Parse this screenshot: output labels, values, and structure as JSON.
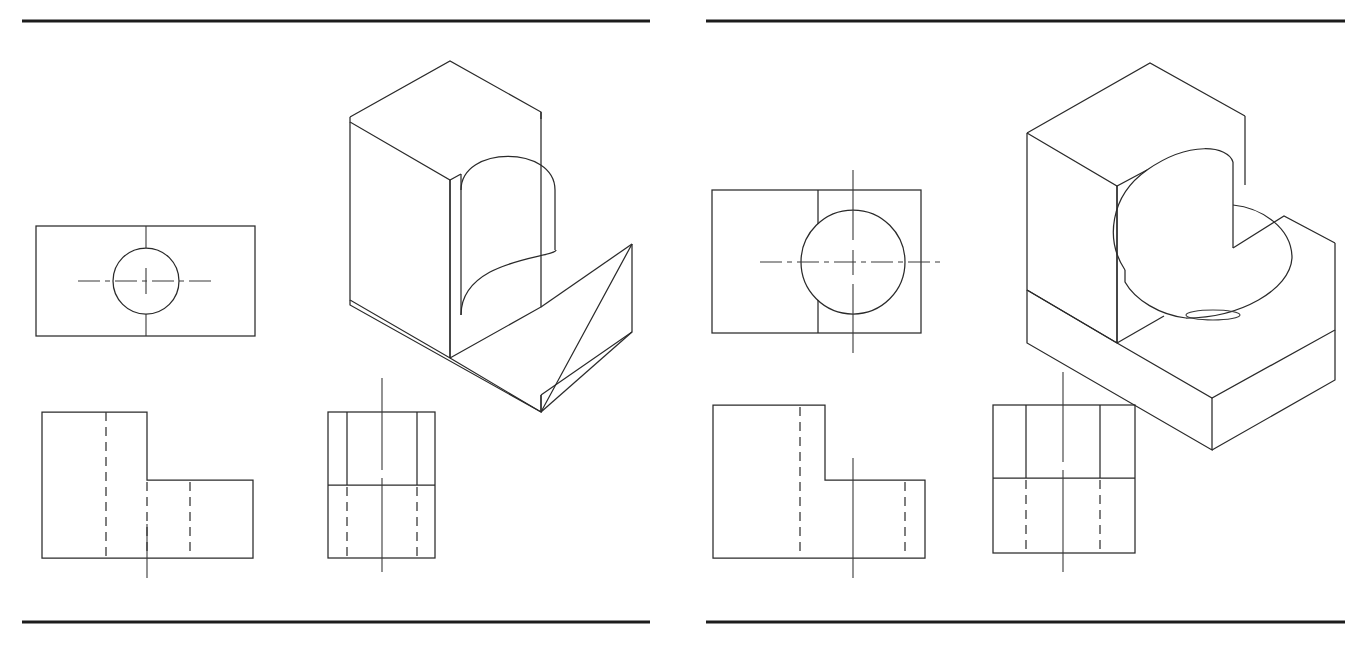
{
  "sheet": {
    "title": "Orthographic and isometric drawing plate",
    "width": 1372,
    "height": 645,
    "background_color": "#ffffff",
    "line_color": "#2a2a2a",
    "rule_color": "#1c1c1c",
    "panel_count": 2
  },
  "panels": [
    {
      "id": "panel-left",
      "name": "left-plate",
      "label": "Left plate",
      "top_rule": {
        "x1": 22,
        "y1": 21,
        "x2": 650,
        "y2": 21
      },
      "bottom_rule": {
        "x1": 22,
        "y1": 622,
        "x2": 650,
        "y2": 622
      },
      "views": [
        {
          "id": "top-view",
          "name": "top-view-left",
          "label": "Top view",
          "outline": {
            "x": 36,
            "y": 226,
            "w": 219,
            "h": 110
          },
          "circle": {
            "cx": 146,
            "cy": 281,
            "r": 33
          },
          "vertical_centerline": {
            "x": 146,
            "y1": 226,
            "y2": 336
          },
          "horizontal_centerline": {
            "y": 281,
            "x1": 78,
            "x2": 214
          },
          "notes": "Rectangle with centered circle, centerlines cross at circle center"
        },
        {
          "id": "front-view",
          "name": "front-view-left",
          "label": "Front view",
          "outline_points": "42,412 147,412 147,480 253,480 253,558 42,558",
          "hidden_lines": [
            {
              "x": 106,
              "y1": 412,
              "y2": 558
            },
            {
              "x": 147,
              "y1": 480,
              "y2": 558
            },
            {
              "x": 190,
              "y1": 480,
              "y2": 558
            }
          ],
          "centerline": {
            "x": 147,
            "y1": 528,
            "y2": 578
          },
          "notes": "L-shaped profile, three hidden lines for the slot, centerline drops below base"
        },
        {
          "id": "side-view",
          "name": "side-view-left",
          "label": "Side view",
          "outline": {
            "x": 328,
            "y": 412,
            "w": 107,
            "h": 146
          },
          "mid_horizontal": {
            "y": 485,
            "x1": 328,
            "x2": 435
          },
          "solid_verticals": [
            {
              "x": 347,
              "y1": 412,
              "y2": 485
            },
            {
              "x": 417,
              "y1": 412,
              "y2": 485
            }
          ],
          "hidden_verticals": [
            {
              "x": 347,
              "y1": 485,
              "y2": 558
            },
            {
              "x": 417,
              "y1": 485,
              "y2": 558
            }
          ],
          "centerline": {
            "x": 382,
            "y1": 378,
            "y2": 572
          },
          "notes": "Rectangle split horizontally; slot edges solid above, hidden below"
        },
        {
          "id": "isometric-view",
          "name": "isometric-view-left",
          "label": "Isometric view",
          "notes": "L-block with a vertical keyhole slot cut into the tall section"
        }
      ]
    },
    {
      "id": "panel-right",
      "name": "right-plate",
      "label": "Right plate",
      "top_rule": {
        "x1": 706,
        "y1": 21,
        "x2": 1345,
        "y2": 21
      },
      "bottom_rule": {
        "x1": 706,
        "y1": 622,
        "x2": 1345,
        "y2": 622
      },
      "views": [
        {
          "id": "top-view",
          "name": "top-view-right",
          "label": "Top view",
          "outline": {
            "x": 712,
            "y": 190,
            "w": 209,
            "h": 143
          },
          "circle": {
            "cx": 853,
            "cy": 262,
            "r": 52
          },
          "slot_edge_vertical": {
            "x": 818,
            "y1": 190,
            "y2": 333
          },
          "vertical_centerline": {
            "x": 853,
            "y1": 170,
            "y2": 353
          },
          "horizontal_centerline": {
            "y": 262,
            "x1": 760,
            "x2": 943
          },
          "notes": "Rectangle with large circle offset right, slot wall line at left of circle"
        },
        {
          "id": "front-view",
          "name": "front-view-right",
          "label": "Front view",
          "outline_points": "713,405 825,405 825,480 925,480 925,558 713,558",
          "hidden_lines": [
            {
              "x": 800,
              "y1": 405,
              "y2": 558
            },
            {
              "x": 905,
              "y1": 480,
              "y2": 558
            }
          ],
          "centerline": {
            "x": 853,
            "y1": 458,
            "y2": 578
          },
          "notes": "L-shaped profile with two hidden lines and a centerline through the bore"
        },
        {
          "id": "side-view",
          "name": "side-view-right",
          "label": "Side view",
          "outline": {
            "x": 993,
            "y": 405,
            "w": 142,
            "h": 148
          },
          "mid_horizontal": {
            "y": 478,
            "x1": 993,
            "x2": 1135
          },
          "solid_verticals": [
            {
              "x": 1026,
              "y1": 405,
              "y2": 478
            },
            {
              "x": 1100,
              "y1": 405,
              "y2": 478
            }
          ],
          "hidden_verticals": [
            {
              "x": 1026,
              "y1": 478,
              "y2": 553
            },
            {
              "x": 1100,
              "y1": 478,
              "y2": 553
            }
          ],
          "centerline": {
            "x": 1063,
            "y1": 372,
            "y2": 572
          },
          "notes": "Rectangle split horizontally; slot edges solid above, hidden below"
        },
        {
          "id": "isometric-view",
          "name": "isometric-view-right",
          "label": "Isometric view",
          "notes": "L-block with a wide U-shaped pocket cut down through the top and open to the low step"
        }
      ]
    }
  ]
}
